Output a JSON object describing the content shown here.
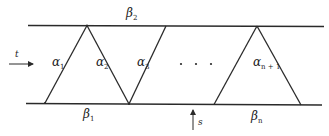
{
  "diagram": {
    "top_boundary_label": {
      "symbol": "β",
      "sub": "2"
    },
    "bottom_boundary_labels": [
      {
        "symbol": "β",
        "sub": "1"
      },
      {
        "symbol": "β",
        "sub": "n"
      }
    ],
    "segment_labels": [
      {
        "symbol": "α",
        "sub": "1"
      },
      {
        "symbol": "α",
        "sub": "2"
      },
      {
        "symbol": "α",
        "sub": "3"
      },
      {
        "symbol": "α",
        "sub": "n + 1"
      }
    ],
    "ellipsis": "· · ·",
    "left_arrow_label": "t",
    "bottom_arrow_label": "s"
  }
}
